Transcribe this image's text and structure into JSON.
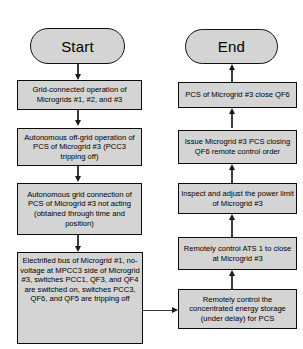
{
  "diagram": {
    "colors": {
      "node_fill": "#d4d4d4",
      "node_border": "#0d0d0d",
      "connector": "#3c3c3c",
      "background": "#ffffff",
      "text": "#000000"
    },
    "terminators": {
      "start": "Start",
      "end": "End"
    },
    "left_column": [
      {
        "id": "L1",
        "text": "Grid-connected operation of Microgrids #1, #2, and #3"
      },
      {
        "id": "L2",
        "text": "Autonomous off-grid operation of PCS of Microgrid #3 (PCC3 tripping off)"
      },
      {
        "id": "L3",
        "text": "Autonomous grid connection of PCS of Microgrid #3 not acting (obtained through time and position)"
      },
      {
        "id": "L4",
        "text": "Electrified bus of Microgrid #1, no-voltage at MPCC3 side of Microgrid #3, switches PCC1, QF3, and QF4 are switched on, switches PCC3, QF6, and QF5 are tripping off"
      }
    ],
    "right_column": [
      {
        "id": "R1",
        "text": "PCS of Microgrid #3 close QF6"
      },
      {
        "id": "R2",
        "text": "Issue Microgrid #3 PCS closing QF6 remote control order"
      },
      {
        "id": "R3",
        "text": "Inspect and adjust the power limit of Microgrid #3"
      },
      {
        "id": "R4",
        "text": "Remotely control ATS 1 to close at Microgrid #3"
      },
      {
        "id": "R5",
        "text": "Remotely control the concentrated energy storage (under delay) for PCS"
      }
    ]
  }
}
